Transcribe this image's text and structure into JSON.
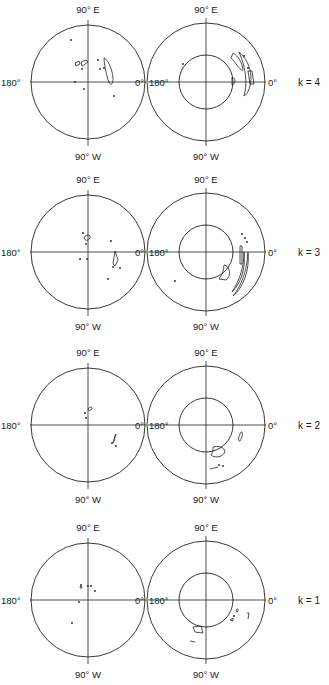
{
  "figure": {
    "labels": {
      "top": "90° E",
      "bottom": "90° W",
      "left": "180°",
      "right": "0°"
    },
    "geometry": {
      "left_cx": 88,
      "right_cx": 206,
      "left_r": 57,
      "right_r": 59,
      "inner_r": 27
    },
    "rows": [
      {
        "k_label": "k = 4",
        "k": 4,
        "cy": 82,
        "left_features": {
          "shapes": [
            "M75,63 L79,61 L80,64 L76,66 Z",
            "M81,62 L86,60 L88,62 L84,65 L82,66 Z",
            "M104,58 C108,60 112,68 113,78 C113,86 110,86 108,80 C106,72 104,64 104,58 Z"
          ],
          "dots": [
            [
              71,
              40
            ],
            [
              82,
              69
            ],
            [
              98,
              60
            ],
            [
              100,
              69
            ],
            [
              104,
              68
            ],
            [
              75,
              82
            ],
            [
              84,
              89
            ],
            [
              114,
              96
            ]
          ]
        },
        "right_features": {
          "shapes": [
            "M233,53 C238,56 242,62 243,70 C241,72 237,64 231,58 Z",
            "M239,52 C246,58 250,66 251,76 C251,86 248,94 244,96 C247,86 247,70 239,52 Z",
            "M248,71 L252,71 L254,84 L250,84 Z",
            "M232,77 C236,78 236,84 232,85 Z"
          ],
          "dots": [
            [
              244,
              56
            ],
            [
              248,
              68
            ],
            [
              183,
              64
            ]
          ]
        }
      },
      {
        "k_label": "k = 3",
        "k": 3,
        "cy": 252,
        "left_features": {
          "shapes": [
            "M84,238 C86,234 91,234 90,238 C88,241 85,241 84,238 Z",
            "M115,251 L118,260 L115,266 L113,264 Z"
          ],
          "dots": [
            [
              83,
              233
            ],
            [
              86,
              244
            ],
            [
              111,
              241
            ],
            [
              80,
              259
            ],
            [
              87,
              259
            ],
            [
              113,
              267
            ],
            [
              120,
              268
            ],
            [
              108,
              279
            ]
          ]
        },
        "right_features": {
          "shapes": [
            "M240,246 L242,246 L242,264 L240,264 Z",
            "M248,252 C250,270 243,288 233,296 C243,284 247,268 248,252 Z",
            "M244,252 C246,270 240,284 232,292 C240,280 244,266 244,252 Z",
            "M224,265 C230,266 232,276 226,280 L219,279 C222,275 224,270 224,265 Z"
          ],
          "dots": [
            [
              242,
              234
            ],
            [
              245,
              238
            ],
            [
              247,
              242
            ],
            [
              175,
              281
            ]
          ]
        }
      },
      {
        "k_label": "k = 2",
        "k": 2,
        "cy": 425,
        "left_features": {
          "shapes": [
            "M88,409 C90,406 93,407 92,409 C90,411 88,411 88,409 Z",
            "M116,434 L114,441 L113,443 L115,436 Z"
          ],
          "dots": [
            [
              85,
              413
            ],
            [
              86,
              418
            ],
            [
              112,
              443
            ],
            [
              116,
              446
            ]
          ]
        },
        "right_features": {
          "shapes": [
            "M241,432 C243,431 243,436 240,441 C238,442 238,437 241,432 Z",
            "M213,447 C218,446 224,446 225,452 C222,458 214,458 211,455 C213,452 213,450 213,447 Z",
            "M210,469 L218,467"
          ],
          "dots": [
            [
              219,
              465
            ],
            [
              223,
              466
            ]
          ]
        }
      },
      {
        "k_label": "k = 1",
        "k": 1,
        "cy": 600,
        "left_features": {
          "shapes": [
            "M81,584 L82,588 L80,588 Z"
          ],
          "dots": [
            [
              88,
              586
            ],
            [
              91,
              586
            ],
            [
              95,
              591
            ],
            [
              79,
              602
            ],
            [
              72,
              623
            ]
          ]
        },
        "right_features": {
          "shapes": [
            "M193,627 L201,626 L203,633 L195,632 Z",
            "M237,609 C238,608 239,611 237,612 C236,611 236,610 237,609 Z",
            "M247,613 L249,613 L248,619",
            "M230,620 L233,618 L233,621 Z",
            "M190,641 L195,642"
          ],
          "dots": [
            [
              234,
              616
            ]
          ]
        }
      }
    ]
  }
}
